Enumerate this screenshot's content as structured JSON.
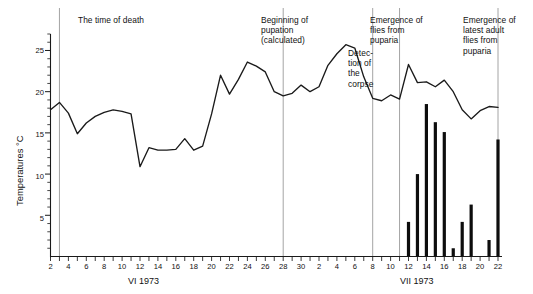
{
  "chart_data": {
    "type": "line",
    "title": "",
    "subtitle": "",
    "ylabel": "Temperatures °C",
    "xlabel_left": "VI 1973",
    "xlabel_right": "VII 1973",
    "ylim": [
      0,
      27
    ],
    "y_ticks_major": [
      5,
      10,
      15,
      20,
      25
    ],
    "y_tick_minor_step": 1,
    "grid": false,
    "legend": "none",
    "x_axis": {
      "note": "Continuous day index: June 2 to July 22, 1973. Minor tick every day, label every 2 days.",
      "june_labels": [
        2,
        4,
        6,
        8,
        10,
        12,
        14,
        16,
        18,
        20,
        22,
        24,
        26,
        28
      ],
      "july_labels": [
        2,
        4,
        6,
        8,
        10,
        12,
        14,
        16,
        18,
        20,
        22
      ],
      "june_start": 2,
      "june_end": 30,
      "july_start": 1,
      "july_end": 22
    },
    "series": [
      {
        "name": "Temperature",
        "type": "line",
        "unit": "°C",
        "x": [
          "VI-2",
          "VI-3",
          "VI-4",
          "VI-5",
          "VI-6",
          "VI-7",
          "VI-8",
          "VI-9",
          "VI-10",
          "VI-11",
          "VI-12",
          "VI-13",
          "VI-14",
          "VI-15",
          "VI-16",
          "VI-17",
          "VI-18",
          "VI-19",
          "VI-20",
          "VI-21",
          "VI-22",
          "VI-23",
          "VI-24",
          "VI-25",
          "VI-26",
          "VI-27",
          "VI-28",
          "VI-29",
          "VI-30",
          "VII-1",
          "VII-2",
          "VII-3",
          "VII-4",
          "VII-5",
          "VII-6",
          "VII-7",
          "VII-8",
          "VII-9",
          "VII-10",
          "VII-11",
          "VII-12",
          "VII-13",
          "VII-14",
          "VII-15",
          "VII-16",
          "VII-17",
          "VII-18",
          "VII-19",
          "VII-20",
          "VII-21",
          "VII-22"
        ],
        "values": [
          17.8,
          18.7,
          17.4,
          14.9,
          16.2,
          17.0,
          17.5,
          17.8,
          17.6,
          17.3,
          10.9,
          13.2,
          12.9,
          12.9,
          13.0,
          14.3,
          12.9,
          13.4,
          17.3,
          22.0,
          19.7,
          21.5,
          23.6,
          23.1,
          22.4,
          20.0,
          19.5,
          19.8,
          20.8,
          20.0,
          20.6,
          23.2,
          24.6,
          25.7,
          25.3,
          21.8,
          19.2,
          18.9,
          19.6,
          19.1,
          23.3,
          21.1,
          21.2,
          20.6,
          21.4,
          20.0,
          17.8,
          16.7,
          17.7,
          18.2,
          18.1
        ]
      },
      {
        "name": "Flies emerged from puparia",
        "type": "bar",
        "unit": "count",
        "x": [
          "VII-12",
          "VII-13",
          "VII-14",
          "VII-15",
          "VII-16",
          "VII-17",
          "VII-18",
          "VII-19",
          "VII-21",
          "VII-22"
        ],
        "values": [
          4.2,
          10.0,
          18.5,
          16.3,
          15.1,
          1.0,
          4.2,
          6.3,
          2.0,
          14.2
        ]
      }
    ],
    "annotations": [
      {
        "id": "time-of-death",
        "label": "The time of death",
        "marker_x": "VI-3"
      },
      {
        "id": "beginning-of-pupation",
        "label": "Beginning of\npupation\n(calculated)",
        "marker_x": "VI-28"
      },
      {
        "id": "detection-of-corpse",
        "label": "Detec-\ntion of\nthe\ncorpse",
        "marker_x": "VII-8"
      },
      {
        "id": "emergence-of-flies",
        "label": "Emergence of\nflies from\npuparia",
        "marker_x": "VII-11"
      },
      {
        "id": "emergence-latest-adult-flies",
        "label": "Emergence of\nlatest adult\nflies from\npuparia",
        "marker_x": "VII-22"
      }
    ]
  },
  "colors": {
    "line": "#1a1a1a",
    "bar": "#0d0d0d",
    "axis": "#1a1a1a",
    "annotation_rule": "#9a9a9a",
    "background": "#ffffff"
  }
}
